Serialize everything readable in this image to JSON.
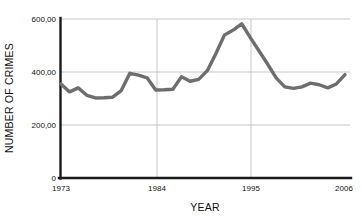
{
  "chart_data": {
    "type": "line",
    "title": "",
    "xlabel": "YEAR",
    "ylabel": "NUMBER OF CRIMES",
    "xlim": [
      1973,
      2006
    ],
    "ylim": [
      0,
      600
    ],
    "grid": true,
    "legend": false,
    "line_color": "#6e6e6e",
    "axis_color": "#1a1a1a",
    "grid_color": "#b9b9b9",
    "x_ticks": [
      "1973",
      "1984",
      "1995",
      "2006"
    ],
    "y_ticks": [
      "0",
      "200,00",
      "400,00",
      "600,00"
    ],
    "x": [
      1973,
      1974,
      1975,
      1976,
      1977,
      1978,
      1979,
      1980,
      1981,
      1982,
      1983,
      1984,
      1985,
      1986,
      1987,
      1988,
      1989,
      1990,
      1991,
      1992,
      1993,
      1994,
      1995,
      1996,
      1997,
      1998,
      1999,
      2000,
      2001,
      2002,
      2003,
      2004,
      2005,
      2006
    ],
    "values": [
      355,
      325,
      340,
      312,
      302,
      303,
      305,
      330,
      395,
      388,
      378,
      332,
      333,
      335,
      382,
      365,
      372,
      405,
      470,
      540,
      558,
      582,
      530,
      480,
      430,
      378,
      344,
      338,
      344,
      358,
      352,
      340,
      355,
      390
    ],
    "series": [
      {
        "name": "Number of crimes",
        "values": [
          355,
          325,
          340,
          312,
          302,
          303,
          305,
          330,
          395,
          388,
          378,
          332,
          333,
          335,
          382,
          365,
          372,
          405,
          470,
          540,
          558,
          582,
          530,
          480,
          430,
          378,
          344,
          338,
          344,
          358,
          352,
          340,
          355,
          390
        ]
      }
    ]
  }
}
